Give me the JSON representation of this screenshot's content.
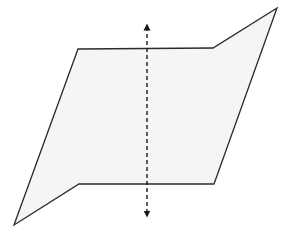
{
  "diagram": {
    "plane": {
      "fill": "#f5f5f5",
      "stroke": "#2b2b2b"
    },
    "axis_arrow": {
      "style": "dashed",
      "direction": "vertical",
      "arrowheads": "both-ends",
      "color": "#1a1a1a"
    }
  }
}
